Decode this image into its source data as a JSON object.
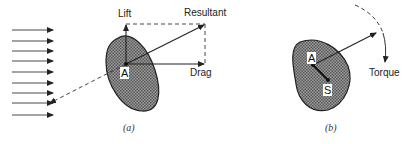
{
  "panel_a": {
    "caption": "(a)",
    "labels": {
      "lift": "Lift",
      "resultant": "Resultant",
      "drag": "Drag",
      "point": "A"
    }
  },
  "panel_b": {
    "caption": "(b)",
    "labels": {
      "torque": "Torque",
      "point_a": "A",
      "point_s": "S"
    }
  }
}
